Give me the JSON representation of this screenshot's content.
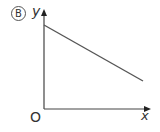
{
  "diagram": {
    "option_label": "B",
    "y_axis_label": "y",
    "x_axis_label": "x",
    "origin_label": "O",
    "line": {
      "description": "straight line with negative slope and positive y-intercept",
      "start": [
        44,
        25
      ],
      "end": [
        143,
        81
      ],
      "color": "#555555"
    },
    "axis_color": "#444444"
  }
}
